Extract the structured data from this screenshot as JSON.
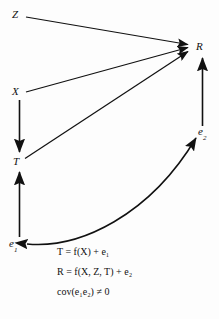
{
  "figure": {
    "type": "path-diagram",
    "background_color": "#fdfdfd",
    "ink_color": "#111111"
  },
  "nodes": {
    "z": {
      "label": "Z",
      "x": 17,
      "y": 15
    },
    "x": {
      "label": "X",
      "x": 17,
      "y": 92
    },
    "t": {
      "label": "T",
      "x": 18,
      "y": 162
    },
    "r": {
      "label": "R",
      "x": 200,
      "y": 47
    },
    "e1": {
      "label": "e",
      "subscript": "1",
      "x": 14,
      "y": 244
    },
    "e2": {
      "label": "e",
      "subscript": "2",
      "x": 204,
      "y": 132
    }
  },
  "edges": [
    {
      "name": "z-to-r",
      "from": "Z",
      "to": "R",
      "style": "straight",
      "arrowheads": "single"
    },
    {
      "name": "x-to-r",
      "from": "X",
      "to": "R",
      "style": "straight",
      "arrowheads": "single"
    },
    {
      "name": "x-to-t",
      "from": "X",
      "to": "T",
      "style": "straight",
      "arrowheads": "single"
    },
    {
      "name": "t-to-r",
      "from": "T",
      "to": "R",
      "style": "straight",
      "arrowheads": "single"
    },
    {
      "name": "e1-to-t",
      "from": "e1",
      "to": "T",
      "style": "straight",
      "arrowheads": "single"
    },
    {
      "name": "e2-to-r",
      "from": "e2",
      "to": "R",
      "style": "straight",
      "arrowheads": "single"
    },
    {
      "name": "e1-e2-covariance",
      "from": "e1",
      "to": "e2",
      "style": "curved",
      "arrowheads": "double"
    }
  ],
  "equations": [
    {
      "id": "eq-1",
      "text": "T = f(X) + e₁"
    },
    {
      "id": "eq-2",
      "text": "R = f(X, Z, T) + e₂"
    },
    {
      "id": "eq-3",
      "text": "cov(e₁e₂) ≠ 0"
    }
  ]
}
